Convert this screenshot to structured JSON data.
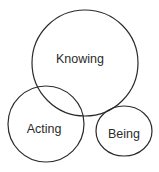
{
  "diagram": {
    "type": "venn",
    "background": "#ffffff",
    "stroke_color": "#2b2b2b",
    "sets": [
      {
        "id": "knowing",
        "label": "Knowing",
        "cx": 85,
        "cy": 63,
        "rx": 53,
        "ry": 53,
        "label_x": 80,
        "label_y": 63
      },
      {
        "id": "acting",
        "label": "Acting",
        "cx": 46,
        "cy": 124,
        "rx": 38,
        "ry": 38,
        "label_x": 44,
        "label_y": 133
      },
      {
        "id": "being",
        "label": "Being",
        "cx": 124,
        "cy": 131,
        "rx": 28,
        "ry": 25,
        "label_x": 124,
        "label_y": 138
      }
    ]
  }
}
